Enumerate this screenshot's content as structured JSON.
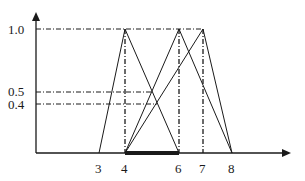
{
  "diagram": {
    "type": "fuzzy-membership-triangles",
    "y_ticks": [
      {
        "label": "1.0",
        "value": 1.0
      },
      {
        "label": "0.5",
        "value": 0.5
      },
      {
        "label": "0.4",
        "value": 0.4
      }
    ],
    "x_ticks": [
      {
        "label": "3",
        "value": 3
      },
      {
        "label": "4",
        "value": 4
      },
      {
        "label": "6",
        "value": 6
      },
      {
        "label": "7",
        "value": 7
      },
      {
        "label": "8",
        "value": 8
      }
    ],
    "triangles": [
      {
        "name": "A",
        "left": 3,
        "peak": 4,
        "right": 6
      },
      {
        "name": "B",
        "left": 4,
        "peak": 6,
        "right": 8
      },
      {
        "name": "C",
        "left": 4,
        "peak": 7,
        "right": 8
      }
    ],
    "bold_interval": {
      "from": 4,
      "to": 6
    },
    "guide_lines": {
      "horizontal": [
        1.0,
        0.5,
        0.4
      ],
      "vertical": [
        4,
        6,
        7
      ]
    },
    "colors": {
      "line": "#1a1a1a",
      "background": "#ffffff"
    }
  }
}
